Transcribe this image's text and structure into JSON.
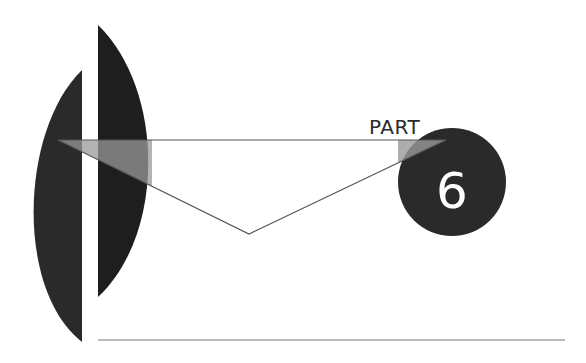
{
  "part": {
    "label": "PART",
    "number": "6"
  },
  "colors": {
    "background": "#ffffff",
    "dark_shape": "#2a2a2a",
    "darker_shape": "#1e1e1e",
    "overlay_gray": "#8a8a8a",
    "line": "#555555"
  }
}
